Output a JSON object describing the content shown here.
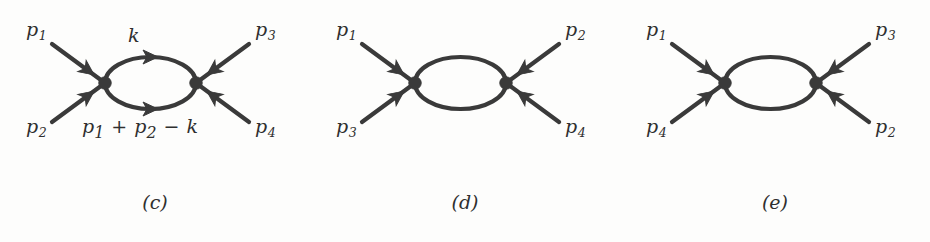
{
  "figure": {
    "background_color": "#fdfdfc",
    "ink_color": "#3a3a3a",
    "text_color": "#2f2f2f",
    "panel_count": 3
  },
  "panels": [
    {
      "id": "panel-c",
      "caption": "(c)",
      "left": 0,
      "loop_label_top": {
        "text": "k",
        "x": 128,
        "y": 26
      },
      "loop_label_bottom": {
        "parts": [
          "p",
          "1",
          " + ",
          "p",
          "2",
          " − ",
          "k"
        ],
        "text": "p₁ + p₂ − k",
        "x": 82,
        "y": 117
      },
      "external_labels": [
        {
          "name": "p1",
          "base": "p",
          "sub": "1",
          "x": 26,
          "y": 20,
          "position": "top-left"
        },
        {
          "name": "p2",
          "base": "p",
          "sub": "2",
          "x": 26,
          "y": 117,
          "position": "bottom-left"
        },
        {
          "name": "p3",
          "base": "p",
          "sub": "3",
          "x": 255,
          "y": 20,
          "position": "top-right"
        },
        {
          "name": "p4",
          "base": "p",
          "sub": "4",
          "x": 255,
          "y": 117,
          "position": "bottom-right"
        }
      ]
    },
    {
      "id": "panel-d",
      "caption": "(d)",
      "left": 310,
      "loop_label_top": null,
      "loop_label_bottom": null,
      "external_labels": [
        {
          "name": "p1",
          "base": "p",
          "sub": "1",
          "x": 26,
          "y": 20,
          "position": "top-left"
        },
        {
          "name": "p3",
          "base": "p",
          "sub": "3",
          "x": 26,
          "y": 117,
          "position": "bottom-left"
        },
        {
          "name": "p2",
          "base": "p",
          "sub": "2",
          "x": 255,
          "y": 20,
          "position": "top-right"
        },
        {
          "name": "p4",
          "base": "p",
          "sub": "4",
          "x": 255,
          "y": 117,
          "position": "bottom-right"
        }
      ]
    },
    {
      "id": "panel-e",
      "caption": "(e)",
      "left": 620,
      "loop_label_top": null,
      "loop_label_bottom": null,
      "external_labels": [
        {
          "name": "p1",
          "base": "p",
          "sub": "1",
          "x": 26,
          "y": 20,
          "position": "top-left"
        },
        {
          "name": "p4",
          "base": "p",
          "sub": "4",
          "x": 26,
          "y": 117,
          "position": "bottom-left"
        },
        {
          "name": "p3",
          "base": "p",
          "sub": "3",
          "x": 255,
          "y": 20,
          "position": "top-right"
        },
        {
          "name": "p2",
          "base": "p",
          "sub": "2",
          "x": 255,
          "y": 117,
          "position": "bottom-right"
        }
      ]
    }
  ],
  "geometry": {
    "vertex_left_x": 105,
    "vertex_right_x": 196,
    "vertex_y": 83,
    "vertex_radius": 6,
    "loop_ry": 26,
    "leg_length_x": 53,
    "leg_length_y": 39,
    "stroke_width": 4.2
  }
}
